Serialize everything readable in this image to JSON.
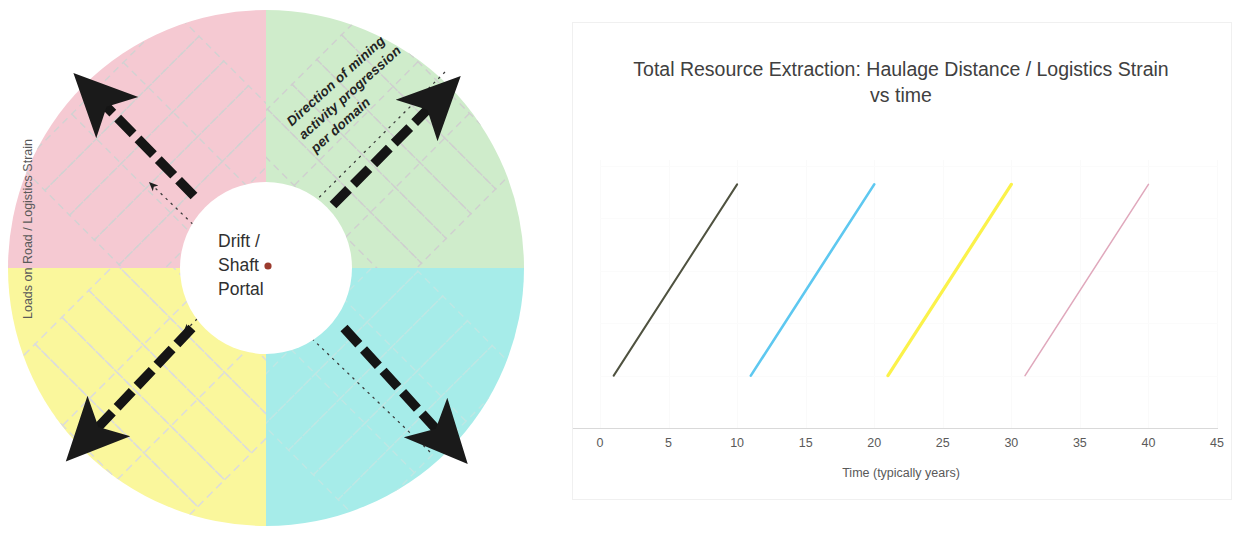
{
  "diagram": {
    "title_center": [
      "Drift /",
      "Shaft",
      "Portal"
    ],
    "annotation": [
      "Direction of mining",
      "activity progression",
      "per domain"
    ],
    "portal_marker_color": "#9b3b2e",
    "quadrants": [
      {
        "name": "north-west-domain",
        "label": "",
        "color": "#f5c9d2",
        "position": "top-left"
      },
      {
        "name": "north-east-domain",
        "label": "",
        "color": "#cfeccb",
        "position": "top-right"
      },
      {
        "name": "south-east-domain",
        "label": "",
        "color": "#a6ece9",
        "position": "bottom-right"
      },
      {
        "name": "south-west-domain",
        "label": "",
        "color": "#faf79c",
        "position": "bottom-left"
      }
    ],
    "arrow_color": "#1a1a1a",
    "hatch_color": "#d7d7d7",
    "circle_center_fill": "#ffffff"
  },
  "chart": {
    "title_line_1": "Total Resource Extraction: Haulage Distance  / Logistics Strain",
    "title_line_2": "vs time"
  },
  "chart_data": {
    "type": "line",
    "title": "Total Resource Extraction: Haulage Distance  / Logistics Strain vs time",
    "xlabel": "Time (typically years)",
    "ylabel": "Loads on Road / Logistics Strain",
    "xlim": [
      0,
      45
    ],
    "ylim": [
      0,
      100
    ],
    "xticks": [
      0,
      5,
      10,
      15,
      20,
      25,
      30,
      35,
      40,
      45
    ],
    "xtick_labels": [
      "0",
      "5",
      "10",
      "15",
      "20",
      "25",
      "30",
      "35",
      "40",
      "45"
    ],
    "yticks": [],
    "ytick_labels": [],
    "grid": true,
    "legend": "none",
    "series": [
      {
        "name": "domain-1",
        "color": "#4f5240",
        "x": [
          1,
          10
        ],
        "y": [
          20,
          93
        ]
      },
      {
        "name": "domain-2",
        "color": "#5ec8f0",
        "x": [
          11,
          20
        ],
        "y": [
          20,
          93
        ]
      },
      {
        "name": "domain-3",
        "color": "#fbf24a",
        "x": [
          21,
          30
        ],
        "y": [
          20,
          93
        ]
      },
      {
        "name": "domain-4",
        "color": "#e0a8bc",
        "x": [
          31,
          40
        ],
        "y": [
          20,
          93
        ]
      }
    ]
  }
}
